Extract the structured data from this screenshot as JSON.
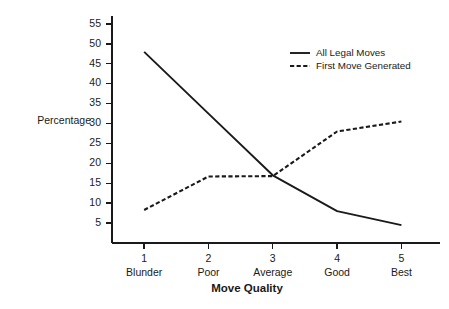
{
  "chart_data": {
    "type": "line",
    "title": "",
    "xlabel": "Move Quality",
    "ylabel": "Percentage",
    "categories": [
      "1",
      "2",
      "3",
      "4",
      "5"
    ],
    "category_names": [
      "Blunder",
      "Poor",
      "Average",
      "Good",
      "Best"
    ],
    "x": [
      1,
      2,
      3,
      4,
      5
    ],
    "xlim": [
      0.5,
      5.6
    ],
    "ylim": [
      0,
      57
    ],
    "ytick_labels": [
      "55",
      "50",
      "45",
      "40",
      "35",
      "30",
      "25",
      "20",
      "15",
      "10",
      "5"
    ],
    "ytick_values": [
      55,
      50,
      45,
      40,
      35,
      30,
      25,
      20,
      15,
      10,
      5
    ],
    "grid": false,
    "legend_position": "top-right",
    "series": [
      {
        "name": "All Legal Moves",
        "style": "solid",
        "color": "#1a1a1a",
        "values": [
          48,
          32.5,
          17,
          8,
          4.5
        ]
      },
      {
        "name": "First Move Generated",
        "style": "dashed",
        "color": "#1a1a1a",
        "values": [
          8.3,
          16.7,
          16.8,
          28,
          30.5
        ]
      }
    ]
  },
  "axes": {
    "y_label": "Percentage",
    "x_label": "Move Quality"
  },
  "legend": {
    "entries": [
      {
        "label": "All Legal Moves",
        "style": "solid"
      },
      {
        "label": "First Move Generated",
        "style": "dashed"
      }
    ]
  },
  "colors": {
    "ink": "#1a1a1a",
    "background": "#ffffff"
  }
}
